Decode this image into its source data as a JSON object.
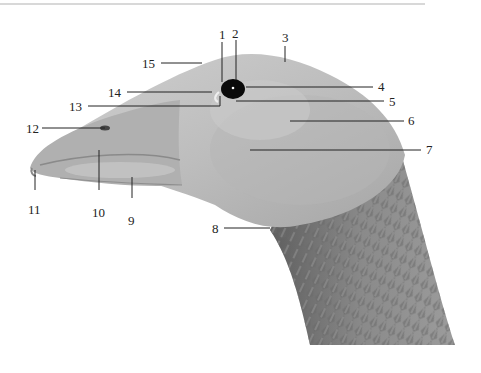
{
  "figure": {
    "labels": [
      {
        "id": "1",
        "text": "1",
        "x": 219,
        "y": 28
      },
      {
        "id": "2",
        "text": "2",
        "x": 232,
        "y": 27
      },
      {
        "id": "3",
        "text": "3",
        "x": 282,
        "y": 31
      },
      {
        "id": "4",
        "text": "4",
        "x": 378,
        "y": 80
      },
      {
        "id": "5",
        "text": "5",
        "x": 389,
        "y": 97
      },
      {
        "id": "6",
        "text": "6",
        "x": 408,
        "y": 116
      },
      {
        "id": "7",
        "text": "7",
        "x": 426,
        "y": 145
      },
      {
        "id": "8",
        "text": "8",
        "x": 212,
        "y": 222
      },
      {
        "id": "9",
        "text": "9",
        "x": 128,
        "y": 214
      },
      {
        "id": "10",
        "text": "10",
        "x": 92,
        "y": 206
      },
      {
        "id": "11",
        "text": "11",
        "x": 28,
        "y": 203
      },
      {
        "id": "12",
        "text": "12",
        "x": 26,
        "y": 123
      },
      {
        "id": "13",
        "text": "13",
        "x": 69,
        "y": 101
      },
      {
        "id": "14",
        "text": "14",
        "x": 108,
        "y": 86
      },
      {
        "id": "15",
        "text": "15",
        "x": 142,
        "y": 57
      }
    ],
    "colors": {
      "line": "#222222",
      "head_light": "#c4c4c4",
      "head_mid": "#a8a8a8",
      "neck_dark": "#7a7a7a",
      "bill": "#b8b8b8",
      "eye": "#0a0a0a"
    }
  }
}
